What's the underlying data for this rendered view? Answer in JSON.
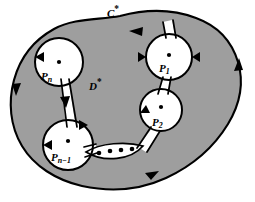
{
  "figure": {
    "type": "math-diagram",
    "colors": {
      "region_fill": "#9e9e9e",
      "hole_fill": "#ffffff",
      "stroke": "#000000",
      "background": "#ffffff"
    },
    "outer_curve": {
      "name": "C*",
      "label_base": "C",
      "label_star": "*",
      "orientation": "counterclockwise"
    },
    "region": {
      "name": "D*",
      "label_base": "D",
      "label_star": "*"
    },
    "holes": [
      {
        "id": "hole-pn",
        "label_base": "P",
        "label_sub": "n",
        "cx": 59,
        "cy": 62,
        "r": 24
      },
      {
        "id": "hole-p1",
        "label_base": "P",
        "label_sub": "1",
        "cx": 169,
        "cy": 57,
        "r": 23
      },
      {
        "id": "hole-p2",
        "label_base": "P",
        "label_sub": "2",
        "cx": 161,
        "cy": 110,
        "r": 21
      },
      {
        "id": "hole-pn1",
        "label_base": "P",
        "label_sub": "n−1",
        "cx": 68,
        "cy": 145,
        "r": 25
      }
    ],
    "ellipsis": {
      "dot_count": 4,
      "note": "dots indicating omitted punctures"
    },
    "arrows": [
      {
        "id": "arrow-top",
        "direction": "left"
      },
      {
        "id": "arrow-right-upper",
        "direction": "up"
      },
      {
        "id": "arrow-left",
        "direction": "down"
      },
      {
        "id": "arrow-bottom",
        "direction": "right"
      },
      {
        "id": "arrow-channel-pn",
        "direction": "down"
      },
      {
        "id": "arrow-hole-pn",
        "direction": "left"
      },
      {
        "id": "arrow-hole-p1-left",
        "direction": "right"
      },
      {
        "id": "arrow-hole-p1-right",
        "direction": "left"
      },
      {
        "id": "arrow-hole-p2",
        "direction": "down"
      },
      {
        "id": "arrow-hole-pn1",
        "direction": "left"
      },
      {
        "id": "arrow-channel-pn1",
        "direction": "right"
      }
    ]
  }
}
